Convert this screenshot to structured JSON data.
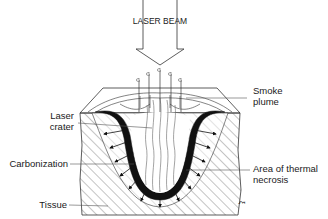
{
  "diagram": {
    "title_label": "LASER BEAM",
    "labels": {
      "smoke_plume_line1": "Smoke",
      "smoke_plume_line2": "plume",
      "laser_crater_line1": "Laser",
      "laser_crater_line2": "crater",
      "carbonization": "Carbonization",
      "thermal_necrosis_line1": "Area of thermal",
      "thermal_necrosis_line2": "necrosis",
      "tissue": "Tissue",
      "figure_mark": "ξ"
    },
    "colors": {
      "line": "#2a2a2a",
      "carbonization": "#111111",
      "hatch": "#555555",
      "label_text": "#1a1a1a",
      "background": "#ffffff"
    }
  }
}
